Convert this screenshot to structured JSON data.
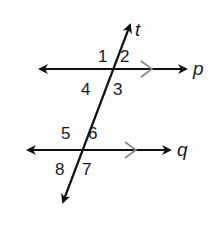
{
  "diagram": {
    "colors": {
      "line": "#111111",
      "parallel_mark": "#888888",
      "background": "#fdfdfd"
    },
    "lines": {
      "p": {
        "label": "p",
        "y": 69,
        "x1": 38,
        "x2": 188
      },
      "q": {
        "label": "q",
        "y": 150,
        "x1": 26,
        "x2": 172
      },
      "t": {
        "label": "t",
        "x1": 62,
        "y1": 205,
        "x2": 131,
        "y2": 22
      }
    },
    "angles": [
      {
        "id": "1",
        "label": "1",
        "x": 98,
        "y": 62
      },
      {
        "id": "2",
        "label": "2",
        "x": 120,
        "y": 62
      },
      {
        "id": "3",
        "label": "3",
        "x": 113,
        "y": 95
      },
      {
        "id": "4",
        "label": "4",
        "x": 81,
        "y": 95
      },
      {
        "id": "5",
        "label": "5",
        "x": 61,
        "y": 139
      },
      {
        "id": "6",
        "label": "6",
        "x": 88,
        "y": 139
      },
      {
        "id": "7",
        "label": "7",
        "x": 82,
        "y": 175
      },
      {
        "id": "8",
        "label": "8",
        "x": 55,
        "y": 175
      }
    ],
    "parallel_marks": [
      "p",
      "q"
    ]
  }
}
